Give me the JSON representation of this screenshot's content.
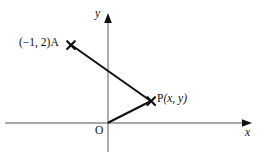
{
  "figure": {
    "type": "coordinate-geometry-diagram",
    "background_color": "#ffffff",
    "axis_color": "#8a8a8a",
    "line_color": "#111111",
    "marker_color": "#111111",
    "width": 268,
    "height": 152
  },
  "axes": {
    "x_axis": {
      "label": "x",
      "start": [
        5,
        123
      ],
      "end": [
        252,
        123
      ],
      "arrow": "right"
    },
    "y_axis": {
      "label": "y",
      "start": [
        108,
        152
      ],
      "end": [
        108,
        14
      ],
      "arrow": "up"
    },
    "origin": {
      "label": "O",
      "position": [
        108,
        123
      ]
    }
  },
  "points": [
    {
      "name": "A",
      "label": "(−1, 2)A",
      "coordinates_text": "(−1, 2)",
      "marker": "cross-marker",
      "position": [
        71,
        45
      ]
    },
    {
      "name": "P",
      "label": "P(x, y)",
      "coordinates_text": "(x, y)",
      "marker": "cross-marker",
      "position": [
        151,
        101
      ]
    }
  ],
  "segments": [
    {
      "name": "segment-a-to-p",
      "from": "A",
      "to": "P"
    },
    {
      "name": "segment-o-to-p",
      "from": "O",
      "to": "P"
    }
  ]
}
